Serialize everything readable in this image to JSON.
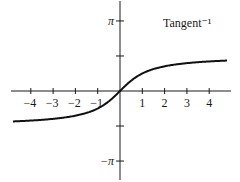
{
  "chart_data": {
    "type": "line",
    "title": "Tangent⁻¹",
    "function": "arctan(x)",
    "xlabel": "",
    "ylabel": "",
    "xlim": [
      -4.8,
      4.8
    ],
    "ylim": [
      -4.0,
      4.0
    ],
    "grid": false,
    "legend": "none",
    "x_ticks": [
      -4,
      -3,
      -2,
      -1,
      1,
      2,
      3,
      4
    ],
    "x_tick_labels": [
      "−4",
      "−3",
      "−2",
      "−1",
      "1",
      "2",
      "3",
      "4"
    ],
    "y_ticks": [
      3.14159,
      1.5708,
      -1.5708,
      -3.14159
    ],
    "y_tick_labels": [
      "π",
      "",
      "",
      "−π"
    ],
    "series": [
      {
        "name": "arctan",
        "x": [
          -4.8,
          -4,
          -3,
          -2,
          -1,
          -0.5,
          0,
          0.5,
          1,
          2,
          3,
          4,
          4.8
        ],
        "y": [
          -1.365,
          -1.326,
          -1.249,
          -1.107,
          -0.785,
          -0.464,
          0,
          0.464,
          0.785,
          1.107,
          1.249,
          1.326,
          1.365
        ]
      }
    ]
  },
  "layout": {
    "origin_px": [
      120,
      91
    ],
    "unit_px": 22.3,
    "axis_color": "#1a1a1a",
    "curve_color": "#111111"
  }
}
